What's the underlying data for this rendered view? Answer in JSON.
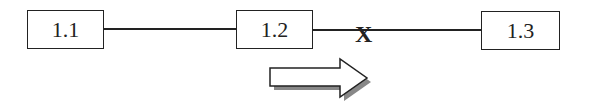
{
  "diagram": {
    "nodes": [
      {
        "id": "n1",
        "label": "1.1"
      },
      {
        "id": "n2",
        "label": "1.2"
      },
      {
        "id": "n3",
        "label": "1.3"
      }
    ],
    "edges": [
      {
        "from": "n1",
        "to": "n2",
        "state": "connected"
      },
      {
        "from": "n2",
        "to": "n3",
        "state": "broken",
        "marker": "X"
      }
    ],
    "arrow": {
      "direction": "right",
      "style": "hollow-with-shadow"
    },
    "colors": {
      "stroke": "#222222",
      "shadow": "#888888",
      "background": "#ffffff"
    }
  }
}
